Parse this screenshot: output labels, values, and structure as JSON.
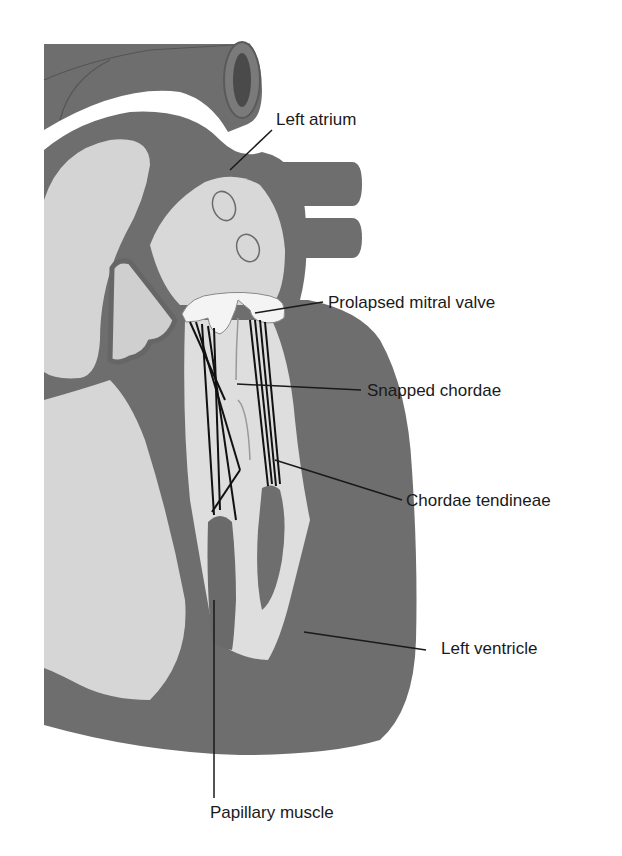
{
  "figure": {
    "colors": {
      "muscle": "#6e6e6e",
      "muscle_dark": "#5a5a5a",
      "chamber": "#d4d4d4",
      "chamber_light": "#e2e2e2",
      "valve": "#f4f4f4",
      "chordae": "#111111",
      "leader": "#1a1a1a",
      "background": "#ffffff"
    },
    "labels": [
      {
        "id": "left-atrium",
        "text": "Left atrium"
      },
      {
        "id": "prolapsed-mitral-valve",
        "text": "Prolapsed mitral valve"
      },
      {
        "id": "snapped-chordae",
        "text": "Snapped chordae"
      },
      {
        "id": "chordae-tendineae",
        "text": "Chordae tendineae"
      },
      {
        "id": "left-ventricle",
        "text": "Left ventricle"
      },
      {
        "id": "papillary-muscle",
        "text": "Papillary muscle"
      }
    ]
  }
}
